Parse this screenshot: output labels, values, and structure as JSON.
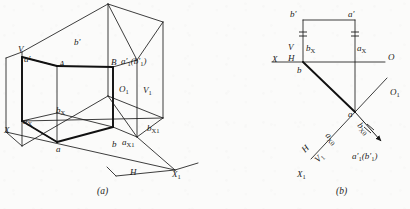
{
  "figure": {
    "type": "engineering-projection-drawing",
    "background_color": "#fbfbfa",
    "line_color": "#1b1b1b",
    "captions": [
      {
        "id": "cap-a",
        "text": "(a)",
        "x": 97,
        "y": 190
      },
      {
        "id": "cap-b",
        "text": "(b)",
        "x": 336,
        "y": 190
      }
    ]
  },
  "panel_a": {
    "name": "pictorial-projection-view",
    "labels": [
      {
        "id": "a-V",
        "html": "V",
        "x": 20,
        "y": 47,
        "italic": true
      },
      {
        "id": "a-aprime",
        "html": "a′",
        "x": 25,
        "y": 57,
        "italic": true
      },
      {
        "id": "a-bprime",
        "html": "b′",
        "x": 75,
        "y": 42,
        "italic": true
      },
      {
        "id": "a-A",
        "html": "A",
        "x": 60,
        "y": 63,
        "italic": true
      },
      {
        "id": "a-B",
        "html": "B",
        "x": 113,
        "y": 62,
        "italic": true
      },
      {
        "id": "a-a1b1",
        "html": "a′<sub>1</sub>(b′<sub>1</sub>)",
        "x": 122,
        "y": 60,
        "italic": true
      },
      {
        "id": "a-O1",
        "html": "O<sub>1</sub>",
        "x": 120,
        "y": 88,
        "italic": true
      },
      {
        "id": "a-V1",
        "html": "V<sub>1</sub>",
        "x": 144,
        "y": 89,
        "italic": true
      },
      {
        "id": "a-bX",
        "html": "b<sub>X</sub>",
        "x": 57,
        "y": 110,
        "italic": true
      },
      {
        "id": "a-aX",
        "html": "a<sub>X</sub>",
        "x": 24,
        "y": 120,
        "italic": true
      },
      {
        "id": "a-X",
        "html": "X",
        "x": 5,
        "y": 128,
        "italic": true
      },
      {
        "id": "a-a",
        "html": "a",
        "x": 57,
        "y": 147,
        "italic": true
      },
      {
        "id": "a-b",
        "html": "b",
        "x": 113,
        "y": 143,
        "italic": true
      },
      {
        "id": "a-aX1",
        "html": "a<sub>X1</sub>",
        "x": 122,
        "y": 141,
        "italic": true
      },
      {
        "id": "a-bX1",
        "html": "b<sub>X1</sub>",
        "x": 148,
        "y": 126,
        "italic": true
      },
      {
        "id": "a-H",
        "html": "H",
        "x": 131,
        "y": 173,
        "italic": true
      },
      {
        "id": "a-X1",
        "html": "X<sub>1</sub>",
        "x": 172,
        "y": 174,
        "italic": true
      }
    ]
  },
  "panel_b": {
    "name": "orthographic-projection-view",
    "labels": [
      {
        "id": "b-bprime",
        "html": "b′",
        "x": 290,
        "y": 14,
        "italic": true
      },
      {
        "id": "b-aprime",
        "html": "a′",
        "x": 348,
        "y": 14,
        "italic": true
      },
      {
        "id": "b-bX",
        "html": "b<sub>X</sub>",
        "x": 300,
        "y": 47,
        "italic": true
      },
      {
        "id": "b-aX",
        "html": "a<sub>X</sub>",
        "x": 344,
        "y": 47,
        "italic": true
      },
      {
        "id": "b-V",
        "html": "V",
        "x": 287,
        "y": 46,
        "italic": true
      },
      {
        "id": "b-H",
        "html": "H",
        "x": 287,
        "y": 57,
        "italic": true
      },
      {
        "id": "b-X",
        "html": "X",
        "x": 272,
        "y": 58,
        "italic": true
      },
      {
        "id": "b-O",
        "html": "O",
        "x": 385,
        "y": 56,
        "italic": true
      },
      {
        "id": "b-b",
        "html": "b",
        "x": 297,
        "y": 69,
        "italic": true
      },
      {
        "id": "b-a",
        "html": "a",
        "x": 348,
        "y": 117,
        "italic": true
      },
      {
        "id": "b-O1",
        "html": "O<sub>1</sub>",
        "x": 389,
        "y": 90,
        "italic": true
      },
      {
        "id": "b-bX0",
        "html": "b<sub>X0</sub>",
        "x": 362,
        "y": 125,
        "italic": true
      },
      {
        "id": "b-aX0",
        "html": "a<sub>X0</sub>",
        "x": 331,
        "y": 135,
        "italic": true
      },
      {
        "id": "b-a1b1",
        "html": "a′<sub>1</sub>(b′<sub>1</sub>)",
        "x": 352,
        "y": 155,
        "italic": true
      },
      {
        "id": "b-H2",
        "html": "H",
        "x": 300,
        "y": 152,
        "italic": true
      },
      {
        "id": "b-V1",
        "html": "V<sub>1</sub>",
        "x": 312,
        "y": 162,
        "italic": true
      },
      {
        "id": "b-X1",
        "html": "X<sub>1</sub>",
        "x": 297,
        "y": 172,
        "italic": true
      }
    ]
  },
  "geometry": {
    "panel_a_thin_lines": [
      "M 22,52 L 22,146",
      "M 22,52 L 108,4",
      "M 108,4 L 108,96",
      "M 22,146 L 108,96",
      "M 108,4 L 163,22",
      "M 163,22 L 163,118",
      "M 108,96 L 163,118",
      "M 108,4 L 137,60",
      "M 137,60 L 137,137",
      "M 137,60 L 163,22",
      "M 137,137 L 163,118",
      "M 137,137 L 175,170",
      "M 108,96 L 137,137",
      "M 22,146 L 6,132",
      "M 6,132 L 6,58",
      "M 6,58 L 22,52",
      "M 22,121 L 163,118",
      "M 22,121 L 57,113",
      "M 57,113 L 57,66",
      "M 57,66 L 22,57",
      "M 113,67 L 113,127",
      "M 57,113 L 113,127",
      "M 113,67 L 137,60",
      "M 113,127 L 137,137",
      "M 6,132 L 175,170",
      "M 175,170 L 196,163",
      "M 118,175 L 175,170",
      "M 118,175 L 108,168"
    ],
    "panel_a_thick_lines": [
      "M 22,57 L 57,66",
      "M 57,66 L 113,67",
      "M 22,57 L 22,121",
      "M 22,121 L 57,142",
      "M 57,142 L 113,127",
      "M 113,127 L 113,67"
    ],
    "panel_b_thin_lines": [
      "M 272,62 L 385,62",
      "M 303,20 L 303,62",
      "M 355,20 L 355,112",
      "M 303,20 L 355,20",
      "M 385,80 L 312,158",
      "M 355,112 L 382,142"
    ],
    "panel_b_thick_lines": [
      "M 303,62 L 355,112"
    ],
    "panel_b_ticks": [
      {
        "x": 303,
        "y": 34
      },
      {
        "x": 355,
        "y": 34
      },
      {
        "x": 368,
        "y": 129
      }
    ],
    "panel_b_arrow": {
      "from": [
        355,
        112
      ],
      "to": [
        384,
        145
      ]
    }
  }
}
